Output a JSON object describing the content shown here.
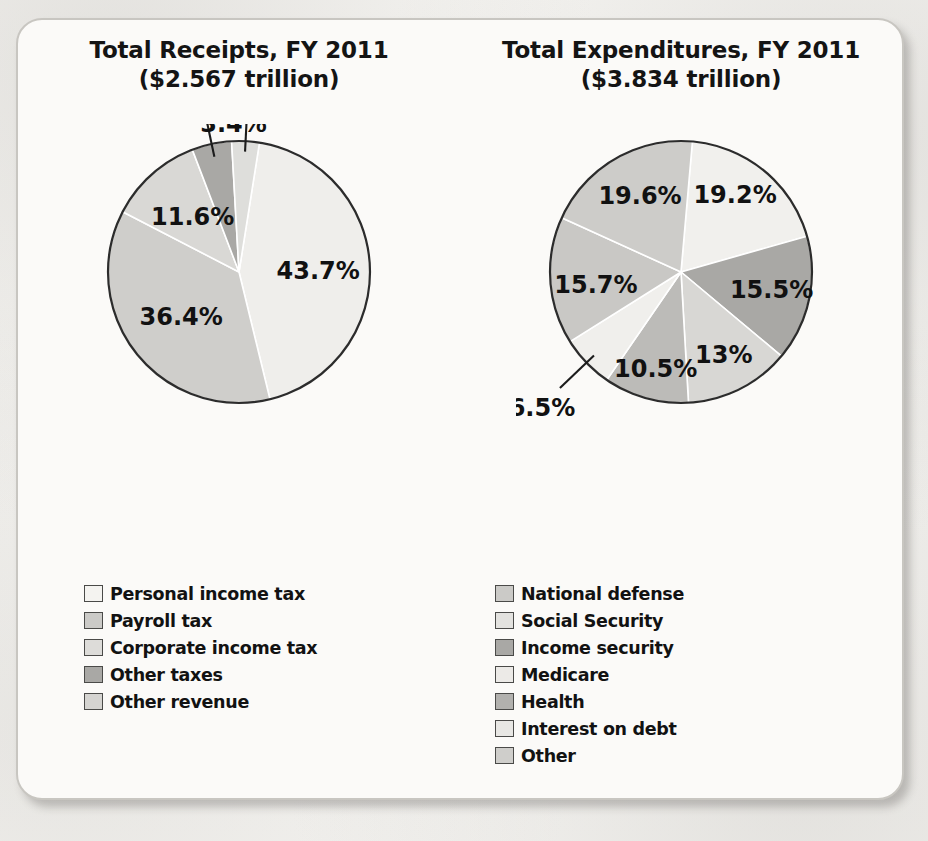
{
  "chart_data": [
    {
      "type": "pie",
      "id": "receipts",
      "title": "Total Receipts, FY 2011",
      "subtitle": "($2.567 trillion)",
      "categories": [
        "Personal income tax",
        "Payroll tax",
        "Corporate income tax",
        "Other taxes",
        "Other revenue"
      ],
      "values": [
        43.7,
        36.4,
        11.6,
        4.9,
        3.4
      ],
      "labels": [
        "43.7%",
        "36.4%",
        "11.6%",
        "4.9%",
        "3.4%"
      ],
      "colors": [
        "#efeeeb",
        "#cfcecb",
        "#d9d8d5",
        "#a9a8a5",
        "#dededb"
      ],
      "unit": "percent",
      "legend_position": "bottom",
      "grid": false
    },
    {
      "type": "pie",
      "id": "expenditures",
      "title": "Total Expenditures, FY 2011",
      "subtitle": "($3.834 trillion)",
      "categories": [
        "National defense",
        "Social Security",
        "Income security",
        "Medicare",
        "Health",
        "Interest on debt",
        "Other"
      ],
      "values": [
        19.2,
        15.5,
        13,
        10.5,
        6.5,
        15.7,
        19.6
      ],
      "labels": [
        "19.2%",
        "15.5%",
        "13%",
        "10.5%",
        "6.5%",
        "15.7%",
        "19.6%"
      ],
      "colors": [
        "#f1f0ed",
        "#a9a8a5",
        "#d8d7d4",
        "#bcbbb8",
        "#f0efec",
        "#c9c8c5",
        "#cdccc9"
      ],
      "unit": "percent",
      "legend_position": "bottom",
      "grid": false
    }
  ],
  "left": {
    "title_line1": "Total Receipts, FY 2011",
    "title_line2": "($2.567 trillion)",
    "legend": [
      {
        "label": "Personal income tax",
        "color": "#f4f3f0"
      },
      {
        "label": "Payroll tax",
        "color": "#cbcac7"
      },
      {
        "label": "Corporate income tax",
        "color": "#dddcd9"
      },
      {
        "label": "Other taxes",
        "color": "#a9a8a5"
      },
      {
        "label": "Other revenue",
        "color": "#d5d4d1"
      }
    ]
  },
  "right": {
    "title_line1": "Total Expenditures, FY 2011",
    "title_line2": "($3.834 trillion)",
    "legend": [
      {
        "label": "National defense",
        "color": "#cbcac7"
      },
      {
        "label": "Social Security",
        "color": "#e3e2df"
      },
      {
        "label": "Income security",
        "color": "#a9a8a5"
      },
      {
        "label": "Medicare",
        "color": "#eceae7"
      },
      {
        "label": "Health",
        "color": "#b2b1ae"
      },
      {
        "label": "Interest on debt",
        "color": "#e8e7e4"
      },
      {
        "label": "Other",
        "color": "#cfcecb"
      }
    ]
  },
  "style": {
    "pie_outline": "#2c2c2c",
    "slice_gap": "#ffffff",
    "card_bg": "#fbfaf8",
    "text": "#121212"
  },
  "background_text": {
    "t1": "the\nSenate bills\nate and\nduring 02:30\nnot rated tax\nto Sec. 8",
    "t2": "a Stop 2",
    "t3": "of doing\nand bill for\nin from",
    "t4": "outline\nand in\nrequires"
  }
}
